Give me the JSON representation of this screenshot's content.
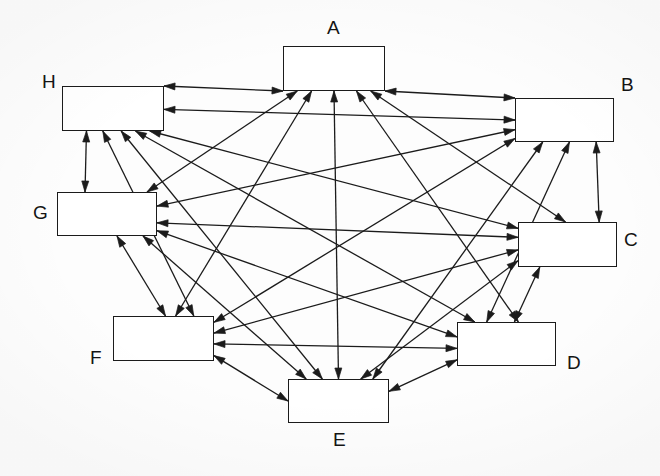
{
  "diagram": {
    "type": "node-link-diagram",
    "canvas": {
      "width": 660,
      "height": 476
    },
    "style": {
      "background_color": "#fdfdfd",
      "box_fill": "#ffffff",
      "box_stroke": "#1b1b1b",
      "edge_color": "#1b1b1b",
      "label_color": "#141414",
      "edge_width": 1.3,
      "arrow_length": 11,
      "arrow_width": 7
    },
    "nodes": [
      {
        "id": "A",
        "label": "A",
        "x": 283,
        "y": 46,
        "w": 102,
        "h": 45,
        "label_x": 327,
        "label_y": 18
      },
      {
        "id": "B",
        "label": "B",
        "x": 515,
        "y": 98,
        "w": 99,
        "h": 44,
        "label_x": 621,
        "label_y": 75
      },
      {
        "id": "C",
        "label": "C",
        "x": 518,
        "y": 222,
        "w": 99,
        "h": 45,
        "label_x": 624,
        "label_y": 230
      },
      {
        "id": "D",
        "label": "D",
        "x": 457,
        "y": 322,
        "w": 99,
        "h": 44,
        "label_x": 567,
        "label_y": 353
      },
      {
        "id": "E",
        "label": "E",
        "x": 288,
        "y": 379,
        "w": 101,
        "h": 44,
        "label_x": 333,
        "label_y": 430
      },
      {
        "id": "F",
        "label": "F",
        "x": 113,
        "y": 316,
        "w": 101,
        "h": 45,
        "label_x": 90,
        "label_y": 348
      },
      {
        "id": "G",
        "label": "G",
        "x": 57,
        "y": 192,
        "w": 100,
        "h": 44,
        "label_x": 33,
        "label_y": 203
      },
      {
        "id": "H",
        "label": "H",
        "x": 62,
        "y": 86,
        "w": 102,
        "h": 45,
        "label_x": 42,
        "label_y": 72
      }
    ],
    "edges": [
      {
        "from": "A",
        "to": "B",
        "bidirectional": true
      },
      {
        "from": "A",
        "to": "C",
        "bidirectional": true
      },
      {
        "from": "A",
        "to": "D",
        "bidirectional": true
      },
      {
        "from": "A",
        "to": "E",
        "bidirectional": true
      },
      {
        "from": "A",
        "to": "F",
        "bidirectional": true
      },
      {
        "from": "A",
        "to": "G",
        "bidirectional": true
      },
      {
        "from": "A",
        "to": "H",
        "bidirectional": true
      },
      {
        "from": "B",
        "to": "C",
        "bidirectional": true
      },
      {
        "from": "B",
        "to": "D",
        "bidirectional": true
      },
      {
        "from": "B",
        "to": "E",
        "bidirectional": true
      },
      {
        "from": "B",
        "to": "F",
        "bidirectional": true
      },
      {
        "from": "B",
        "to": "G",
        "bidirectional": true
      },
      {
        "from": "B",
        "to": "H",
        "bidirectional": true
      },
      {
        "from": "C",
        "to": "D",
        "bidirectional": true
      },
      {
        "from": "C",
        "to": "E",
        "bidirectional": true
      },
      {
        "from": "C",
        "to": "F",
        "bidirectional": true
      },
      {
        "from": "C",
        "to": "G",
        "bidirectional": true
      },
      {
        "from": "C",
        "to": "H",
        "bidirectional": true
      },
      {
        "from": "D",
        "to": "E",
        "bidirectional": true
      },
      {
        "from": "D",
        "to": "F",
        "bidirectional": true
      },
      {
        "from": "D",
        "to": "G",
        "bidirectional": true
      },
      {
        "from": "D",
        "to": "H",
        "bidirectional": true
      },
      {
        "from": "E",
        "to": "F",
        "bidirectional": true
      },
      {
        "from": "E",
        "to": "G",
        "bidirectional": true
      },
      {
        "from": "E",
        "to": "H",
        "bidirectional": true
      },
      {
        "from": "F",
        "to": "G",
        "bidirectional": true
      },
      {
        "from": "F",
        "to": "H",
        "bidirectional": true
      },
      {
        "from": "G",
        "to": "H",
        "bidirectional": true
      }
    ],
    "edge_anchors": {
      "A-B": {
        "a": "br",
        "b": "lt"
      },
      "A-C": {
        "a": "bottom",
        "b": "top",
        "ai": 0.86,
        "bi": 0.48
      },
      "A-D": {
        "a": "bottom",
        "b": "top",
        "ai": 0.72,
        "bi": 0.62
      },
      "A-E": {
        "a": "bottom",
        "b": "top",
        "ai": 0.5,
        "bi": 0.5
      },
      "A-F": {
        "a": "bottom",
        "b": "top",
        "ai": 0.28,
        "bi": 0.62
      },
      "A-G": {
        "a": "bottom",
        "b": "top",
        "ai": 0.14,
        "bi": 0.9
      },
      "A-H": {
        "a": "bl",
        "b": "rt"
      },
      "B-C": {
        "a": "bottom",
        "b": "top",
        "ai": 0.82,
        "bi": 0.82
      },
      "B-D": {
        "a": "bottom",
        "b": "top",
        "ai": 0.55,
        "bi": 0.3
      },
      "B-E": {
        "a": "bottom",
        "b": "top",
        "ai": 0.28,
        "bi": 0.84
      },
      "B-F": {
        "a": "left",
        "b": "right",
        "ai": 0.92,
        "bi": 0.14
      },
      "B-G": {
        "a": "left",
        "b": "right",
        "ai": 0.72,
        "bi": 0.32
      },
      "B-H": {
        "a": "left",
        "b": "right",
        "ai": 0.5,
        "bi": 0.52
      },
      "C-D": {
        "a": "bottom",
        "b": "top",
        "ai": 0.22,
        "bi": 0.58
      },
      "C-E": {
        "a": "left",
        "b": "top",
        "ai": 0.86,
        "bi": 0.72
      },
      "C-F": {
        "a": "left",
        "b": "right",
        "ai": 0.62,
        "bi": 0.38
      },
      "C-G": {
        "a": "left",
        "b": "right",
        "ai": 0.34,
        "bi": 0.7
      },
      "C-H": {
        "a": "left",
        "b": "bottom",
        "ai": 0.14,
        "bi": 0.86
      },
      "D-E": {
        "a": "left",
        "b": "right",
        "ai": 0.86,
        "bi": 0.28
      },
      "D-F": {
        "a": "left",
        "b": "right",
        "ai": 0.6,
        "bi": 0.62
      },
      "D-G": {
        "a": "left",
        "b": "right",
        "ai": 0.34,
        "bi": 0.88
      },
      "D-H": {
        "a": "top",
        "b": "bottom",
        "ai": 0.18,
        "bi": 0.72
      },
      "E-F": {
        "a": "left",
        "b": "right",
        "ai": 0.5,
        "bi": 0.88
      },
      "E-G": {
        "a": "top",
        "b": "bottom",
        "ai": 0.18,
        "bi": 0.86
      },
      "E-H": {
        "a": "top",
        "b": "bottom",
        "ai": 0.34,
        "bi": 0.58
      },
      "F-G": {
        "a": "top",
        "b": "bottom",
        "ai": 0.52,
        "bi": 0.6
      },
      "F-H": {
        "a": "top",
        "b": "bottom",
        "ai": 0.8,
        "bi": 0.4
      },
      "G-H": {
        "a": "top",
        "b": "bottom",
        "ai": 0.28,
        "bi": 0.24
      }
    }
  }
}
